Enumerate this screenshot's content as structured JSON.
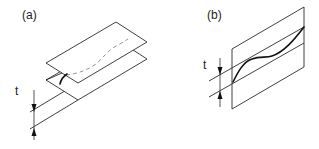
{
  "figure": {
    "panels": [
      {
        "id": "a",
        "label": "(a)",
        "dimension_label": "t",
        "description": "Two parallel inclined planes separated by thickness t; a curve on the lower plane traced as dashed on the upper plane"
      },
      {
        "id": "b",
        "label": "(b)",
        "dimension_label": "t",
        "description": "Vertical plane with a wavy curve lying between two parallel lines separated by thickness t"
      }
    ],
    "colors": {
      "line": "#2a2a2a",
      "curve": "#111111",
      "dashed": "#888888",
      "background": "#ffffff"
    }
  }
}
